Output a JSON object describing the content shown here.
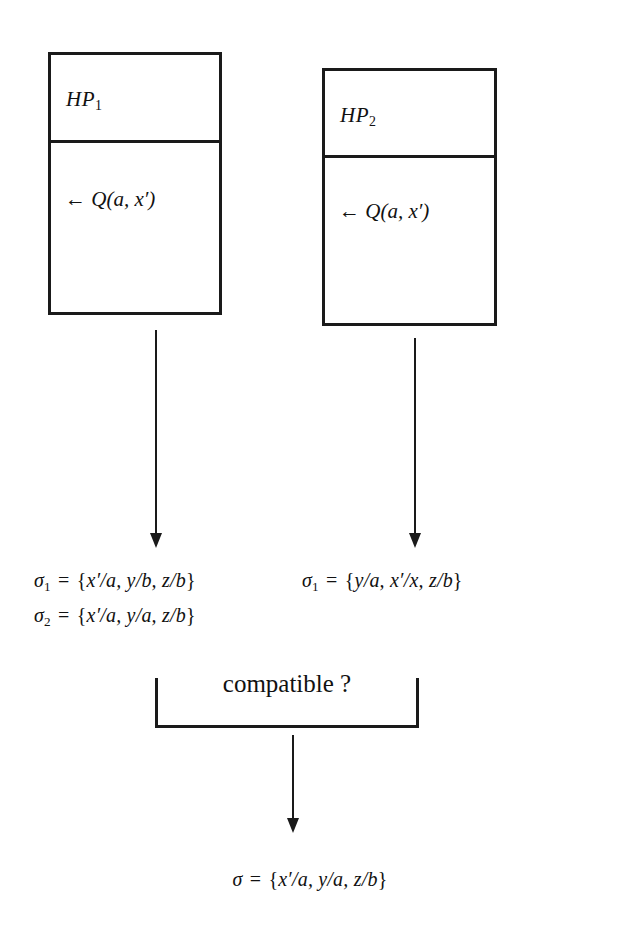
{
  "diagram": {
    "boxes": [
      {
        "id": "hp1",
        "header": "HP",
        "header_subscript": "1",
        "body_arrow": "←",
        "body_goal": "Q(a, x′)"
      },
      {
        "id": "hp2",
        "header": "HP",
        "header_subscript": "2",
        "body_arrow": "←",
        "body_goal": "Q(a, x′)"
      }
    ],
    "left_substitutions": [
      {
        "name": "σ",
        "subscript": "1",
        "equals": "=",
        "open": "{",
        "bindings": "x′/a, y/b, z/b",
        "close": "}"
      },
      {
        "name": "σ",
        "subscript": "2",
        "equals": "=",
        "open": "{",
        "bindings": "x′/a, y/a, z/b",
        "close": "}"
      }
    ],
    "right_substitutions": [
      {
        "name": "σ",
        "subscript": "1",
        "equals": "=",
        "open": "{",
        "bindings": "y/a, x′/x, z/b",
        "close": "}"
      }
    ],
    "junction": {
      "label": "compatible ?"
    },
    "result_substitution": {
      "name": "σ",
      "subscript": "",
      "equals": "=",
      "open": "{",
      "bindings": "x′/a, y/a, z/b",
      "close": "}"
    },
    "arrows": [
      {
        "id": "arrow-hp1-to-sigma",
        "direction": "down"
      },
      {
        "id": "arrow-hp2-to-sigma",
        "direction": "down"
      },
      {
        "id": "arrow-compatible-to-result",
        "direction": "down"
      }
    ],
    "colors": {
      "ink": "#1a1a1a",
      "paper": "#ffffff"
    }
  }
}
